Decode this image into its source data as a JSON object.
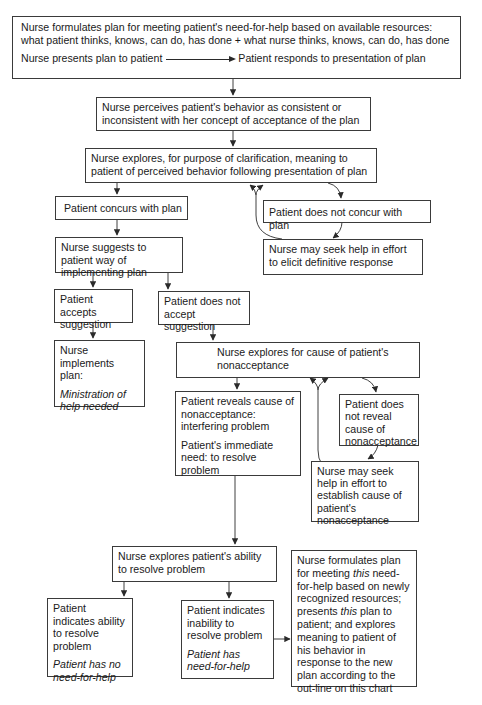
{
  "nodes": {
    "formulate_plan": {
      "line1": "Nurse formulates plan for meeting patient's need-for-help based on available resources:",
      "line2": "what patient thinks, knows, can do, has done + what nurse thinks, knows, can do, has done",
      "presents": "Nurse presents plan to patient",
      "responds": "Patient responds to presentation of plan"
    },
    "perceives": "Nurse perceives patient's behavior as consistent or inconsistent with her concept of acceptance of the plan",
    "explores_clarification": "Nurse explores, for purpose of clarification, meaning to patient of perceived behavior following presentation of plan",
    "concurs": "Patient concurs with plan",
    "not_concur": "Patient does not concur with plan",
    "seek_help_response": "Nurse may seek help in effort to elicit definitive response",
    "suggests": "Nurse suggests to patient way of implementing plan",
    "accepts": "Patient accepts suggestion",
    "not_accept": "Patient does not accept suggestion",
    "implements": {
      "text": "Nurse implements plan:",
      "italic": "Ministration of help needed"
    },
    "explores_cause": "Nurse explores for cause of patient's nonacceptance",
    "reveals": {
      "text": "Patient reveals cause of nonacceptance: interfering problem",
      "need": "Patient's immediate need: to resolve problem"
    },
    "not_reveal": "Patient does not reveal cause of nonacceptance",
    "seek_help_cause": "Nurse may seek help in effort to establish cause of patient's nonacceptance",
    "explores_ability": "Nurse explores patient's ability to resolve problem",
    "ability": {
      "text": "Patient indicates ability to resolve problem",
      "italic": "Patient has no need-for-help"
    },
    "inability": {
      "text": "Patient indicates inability to resolve problem",
      "italic": "Patient has need-for-help"
    },
    "new_plan": {
      "a": "Nurse formulates plan for meeting ",
      "a_it": "this",
      "b": " need-for-help based on newly recognized resources; presents ",
      "b_it": "this",
      "c": " plan to patient; and explores meaning to patient of his behavior in response to the new plan according to the out-line on this chart"
    }
  }
}
